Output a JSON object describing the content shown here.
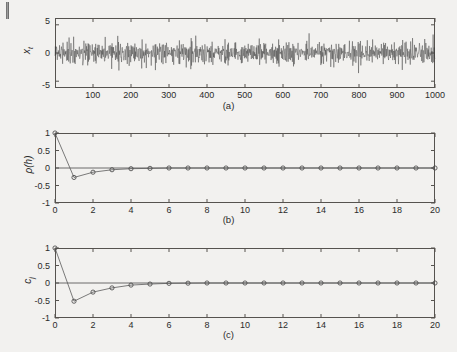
{
  "figure": {
    "background_color": "#f2f1ef",
    "line_color": "#3a3a3a",
    "axis_color": "#56534f",
    "marker_color": "#4a4a4a"
  },
  "panels": [
    {
      "id": "a",
      "caption": "(a)",
      "ylabel_main": "x",
      "ylabel_sub": "t",
      "yticks": [
        "5",
        "0",
        "-5"
      ],
      "xticks": [
        "100",
        "200",
        "300",
        "400",
        "500",
        "600",
        "700",
        "800",
        "900",
        "1000"
      ]
    },
    {
      "id": "b",
      "caption": "(b)",
      "ylabel_main": "ρ(h)",
      "ylabel_sub": "",
      "yticks": [
        "1",
        "0.5",
        "0",
        "-0.5",
        "-1"
      ],
      "xticks": [
        "0",
        "2",
        "4",
        "6",
        "8",
        "10",
        "12",
        "14",
        "16",
        "18",
        "20"
      ]
    },
    {
      "id": "c",
      "caption": "(c)",
      "ylabel_main": "c",
      "ylabel_sub": "j",
      "yticks": [
        "1",
        "0.5",
        "0",
        "-0.5",
        "-1"
      ],
      "xticks": [
        "0",
        "2",
        "4",
        "6",
        "8",
        "10",
        "12",
        "14",
        "16",
        "18",
        "20"
      ]
    }
  ],
  "chart_data": [
    {
      "type": "line",
      "panel": "a",
      "title": "",
      "caption": "(a)",
      "xlabel": "",
      "ylabel": "x_t",
      "xlim": [
        1,
        1000
      ],
      "ylim": [
        -5.8,
        5.8
      ],
      "yticks": [
        5,
        0,
        -5
      ],
      "xticks": [
        100,
        200,
        300,
        400,
        500,
        600,
        700,
        800,
        900,
        1000
      ],
      "grid": false,
      "legend": "none",
      "description": "Simulated moving-average white-noise series of 1000 observations, zero mean, amplitude mostly within +/-2.5 with occasional spikes near +/-3.8",
      "series": [
        {
          "name": "x_t",
          "n_points": 1000,
          "mean": 0.0,
          "sd": 1.0,
          "min": -3.9,
          "max": 3.6
        }
      ]
    },
    {
      "type": "line",
      "panel": "b",
      "title": "",
      "caption": "(b)",
      "xlabel": "h",
      "ylabel": "ρ(h)",
      "xlim": [
        0,
        20
      ],
      "ylim": [
        -1,
        1
      ],
      "yticks": [
        1,
        0.5,
        0,
        -0.5,
        -1
      ],
      "xticks": [
        0,
        2,
        4,
        6,
        8,
        10,
        12,
        14,
        16,
        18,
        20
      ],
      "grid": false,
      "legend": "none",
      "markers": "open-circle",
      "x": [
        0,
        1,
        2,
        3,
        4,
        5,
        6,
        7,
        8,
        9,
        10,
        11,
        12,
        13,
        14,
        15,
        16,
        17,
        18,
        19,
        20
      ],
      "values": [
        1.0,
        -0.27,
        -0.12,
        -0.05,
        -0.02,
        -0.01,
        0.0,
        0.0,
        0.0,
        0.0,
        0.0,
        0.0,
        0.0,
        0.0,
        0.0,
        0.0,
        0.0,
        0.0,
        0.0,
        0.0,
        0.0
      ]
    },
    {
      "type": "line",
      "panel": "c",
      "title": "",
      "caption": "(c)",
      "xlabel": "j",
      "ylabel": "c_j",
      "xlim": [
        0,
        20
      ],
      "ylim": [
        -1,
        1
      ],
      "yticks": [
        1,
        0.5,
        0,
        -0.5,
        -1
      ],
      "xticks": [
        0,
        2,
        4,
        6,
        8,
        10,
        12,
        14,
        16,
        18,
        20
      ],
      "grid": false,
      "legend": "none",
      "markers": "open-circle",
      "x": [
        0,
        1,
        2,
        3,
        4,
        5,
        6,
        7,
        8,
        9,
        10,
        11,
        12,
        13,
        14,
        15,
        16,
        17,
        18,
        19,
        20
      ],
      "values": [
        1.0,
        -0.52,
        -0.26,
        -0.14,
        -0.06,
        -0.03,
        -0.01,
        -0.005,
        0.0,
        0.0,
        0.0,
        0.0,
        0.0,
        0.0,
        0.0,
        0.0,
        0.0,
        0.0,
        0.0,
        0.0,
        0.0
      ]
    }
  ]
}
